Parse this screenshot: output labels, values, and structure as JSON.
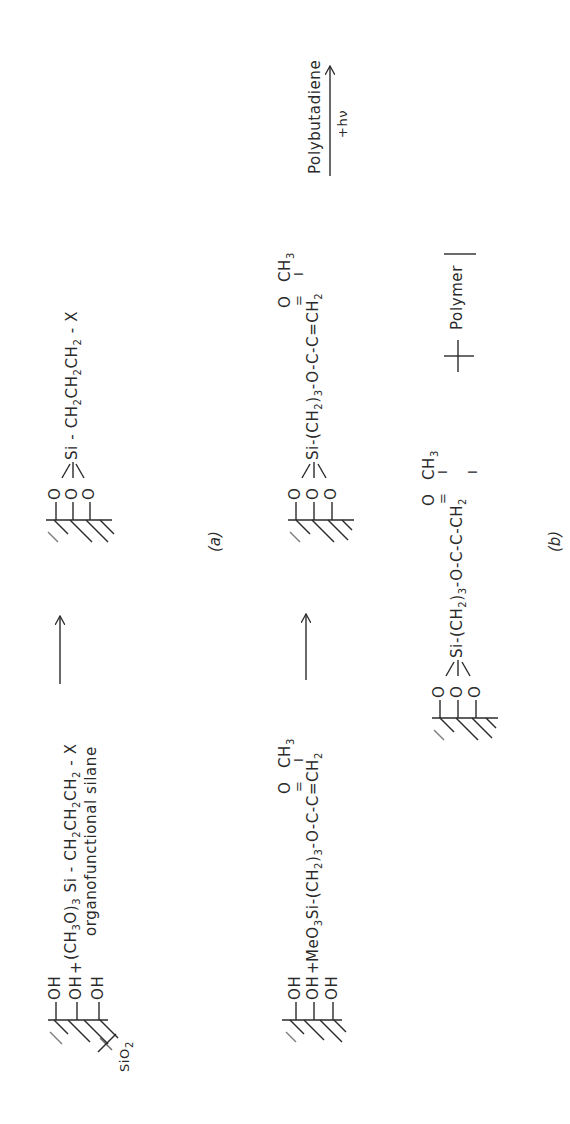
{
  "figure": {
    "orientation": "rotated 90 degrees counter-clockwise",
    "panels": [
      {
        "label": "(a)",
        "reactions": [
          {
            "substrate_label": "SiO",
            "substrate_label_sub": "2",
            "surface_groups": [
              "OH",
              "OH",
              "OH"
            ],
            "plus": "+",
            "reagent": {
              "prefix": "(CH",
              "sub1": "3",
              "mid": "O)",
              "sub2": "3",
              "chain_a": " Si - CH",
              "sub3": "2",
              "chain_b": "CH",
              "sub4": "2",
              "chain_c": "CH",
              "sub5": "2",
              "tail": " - X"
            },
            "reagent_caption": "organofunctional  silane",
            "product": {
              "surface_atoms": [
                "O",
                "O",
                "O"
              ],
              "chain_a": "Si - CH",
              "sub1": "2",
              "chain_b": "CH",
              "sub2": "2",
              "chain_c": "CH",
              "sub3": "2",
              "tail": " - X"
            }
          },
          {
            "surface_groups": [
              "OH",
              "OH",
              "OH"
            ],
            "plus": "+",
            "reagent": {
              "prefix": "MeO",
              "sub1": "3",
              "chain_a": "Si-(CH",
              "sub2": "2",
              "chain_b": ")",
              "sub3": "3",
              "chain_c": "-O-C-C=CH",
              "sub4": "2",
              "carbonyl_o": "O",
              "double_bond": "=",
              "methyl": "CH",
              "methyl_sub": "3",
              "single_bond": "I"
            },
            "product": {
              "surface_atoms": [
                "O",
                "O",
                "O"
              ],
              "chain_a": "Si-(CH",
              "sub1": "2",
              "chain_b": ")",
              "sub2": "3",
              "chain_c": "-O-C-C=CH",
              "sub3": "2",
              "carbonyl_o": "O",
              "double_bond": "=",
              "methyl": "CH",
              "methyl_sub": "3",
              "single_bond": "I"
            },
            "arrow_top": "Polybutadiene",
            "arrow_bottom": "+hν"
          }
        ]
      },
      {
        "label": "(b)",
        "product": {
          "surface_atoms": [
            "O",
            "O",
            "O"
          ],
          "chain_a": "Si-(CH",
          "sub1": "2",
          "chain_b": ")",
          "sub2": "3",
          "chain_c": "-O-C-C-CH",
          "sub3": "2",
          "carbonyl_o": "O",
          "double_bond": "=",
          "methyl": "CH",
          "methyl_sub": "3",
          "single_bond": "I",
          "polymer_label": "Polymer"
        }
      }
    ],
    "colors": {
      "ink": "#2a2a2a",
      "background": "#ffffff"
    }
  }
}
